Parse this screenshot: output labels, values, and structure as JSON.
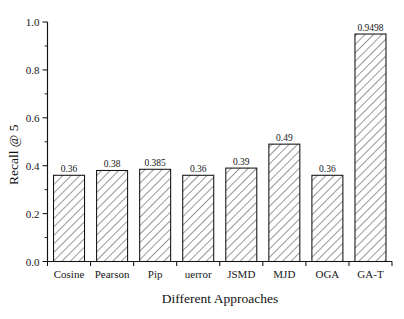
{
  "chart_data": {
    "type": "bar",
    "title": "",
    "xlabel": "Different Approaches",
    "ylabel": "Recall @ 5",
    "categories": [
      "Cosine",
      "Pearson",
      "Pip",
      "uerror",
      "JSMD",
      "MJD",
      "OGA",
      "GA-T"
    ],
    "values": [
      0.36,
      0.38,
      0.385,
      0.36,
      0.39,
      0.49,
      0.36,
      0.9498
    ],
    "value_labels": [
      "0.36",
      "0.38",
      "0.385",
      "0.36",
      "0.39",
      "0.49",
      "0.36",
      "0.9498"
    ],
    "ylim": [
      0.0,
      1.0
    ],
    "xlim_categories": 8,
    "y_major_ticks": [
      0.0,
      0.2,
      0.4,
      0.6,
      0.8,
      1.0
    ],
    "y_tick_labels": [
      "0.0",
      "0.2",
      "0.4",
      "0.6",
      "0.8",
      "1.0"
    ],
    "y_minor_ticks": [
      0.1,
      0.3,
      0.5,
      0.7,
      0.9
    ],
    "grid": false,
    "legend": "none",
    "series": [
      {
        "name": "Recall @ 5",
        "values": [
          0.36,
          0.38,
          0.385,
          0.36,
          0.39,
          0.49,
          0.36,
          0.9498
        ]
      }
    ],
    "bar_style": {
      "fill": "#ffffff",
      "hatch": "diagonal-45",
      "hatch_color": "#4a4a4a",
      "edge_color": "#111111"
    },
    "axis_style": {
      "spines": [
        "left",
        "bottom"
      ],
      "tick_direction": "out",
      "axis_color": "#111111"
    }
  },
  "axes": {
    "y_title": "Recall @ 5",
    "x_title": "Different Approaches"
  }
}
